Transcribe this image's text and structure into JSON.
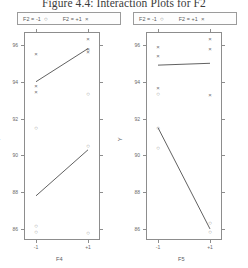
{
  "figure": {
    "title": "Figure 4.4: Interaction Plots for F2"
  },
  "legend": {
    "left": {
      "series_a_label": "F2 = -1",
      "series_a_symbol": "○",
      "series_b_label": "F2 = +1",
      "series_b_symbol": "×"
    },
    "right": {
      "series_a_label": "F2 = -1",
      "series_a_symbol": "○",
      "series_b_label": "F2 = +1",
      "series_b_symbol": "×"
    }
  },
  "chart_data": [
    {
      "type": "line",
      "panel": "left",
      "title": "",
      "xlabel": "F4",
      "ylabel": "Y",
      "x": [
        -1,
        1
      ],
      "xtick_labels": [
        "-1",
        "+1"
      ],
      "ylim": [
        85.4,
        96.7
      ],
      "yticks": [
        86,
        88,
        90,
        92,
        94,
        96
      ],
      "ytick_labels": [
        "86",
        "88",
        "90",
        "92",
        "94",
        "96"
      ],
      "grid": false,
      "legend_position": "top",
      "series": [
        {
          "name": "F2 = +1",
          "symbol": "×",
          "values": [
            94.0,
            95.8
          ],
          "points": [
            {
              "x": -1,
              "y": 95.5
            },
            {
              "x": -1,
              "y": 93.75
            },
            {
              "x": -1,
              "y": 93.45
            },
            {
              "x": 1,
              "y": 96.3
            },
            {
              "x": 1,
              "y": 95.8
            },
            {
              "x": 1,
              "y": 95.6
            }
          ]
        },
        {
          "name": "F2 = -1",
          "symbol": "○",
          "values": [
            87.8,
            90.3
          ],
          "points": [
            {
              "x": -1,
              "y": 91.5
            },
            {
              "x": -1,
              "y": 86.15
            },
            {
              "x": -1,
              "y": 85.85
            },
            {
              "x": 1,
              "y": 95.7
            },
            {
              "x": 1,
              "y": 93.35
            },
            {
              "x": 1,
              "y": 90.5
            },
            {
              "x": 1,
              "y": 85.8
            }
          ]
        }
      ]
    },
    {
      "type": "line",
      "panel": "right",
      "title": "",
      "xlabel": "F5",
      "ylabel": "Y",
      "x": [
        -1,
        1
      ],
      "xtick_labels": [
        "-1",
        "+1"
      ],
      "ylim": [
        85.4,
        96.7
      ],
      "yticks": [
        86,
        88,
        90,
        92,
        94,
        96
      ],
      "ytick_labels": [
        "86",
        "88",
        "90",
        "92",
        "94",
        "96"
      ],
      "grid": false,
      "legend_position": "top",
      "series": [
        {
          "name": "F2 = +1",
          "symbol": "×",
          "values": [
            94.9,
            95.0
          ],
          "points": [
            {
              "x": -1,
              "y": 95.9
            },
            {
              "x": -1,
              "y": 95.4
            },
            {
              "x": -1,
              "y": 93.65
            },
            {
              "x": 1,
              "y": 96.3
            },
            {
              "x": 1,
              "y": 95.8
            },
            {
              "x": 1,
              "y": 93.3
            }
          ]
        },
        {
          "name": "F2 = -1",
          "symbol": "○",
          "values": [
            91.5,
            86.0
          ],
          "points": [
            {
              "x": -1,
              "y": 93.35
            },
            {
              "x": -1,
              "y": 91.5
            },
            {
              "x": -1,
              "y": 90.4
            },
            {
              "x": 1,
              "y": 86.3
            },
            {
              "x": 1,
              "y": 85.85
            }
          ]
        }
      ]
    }
  ]
}
